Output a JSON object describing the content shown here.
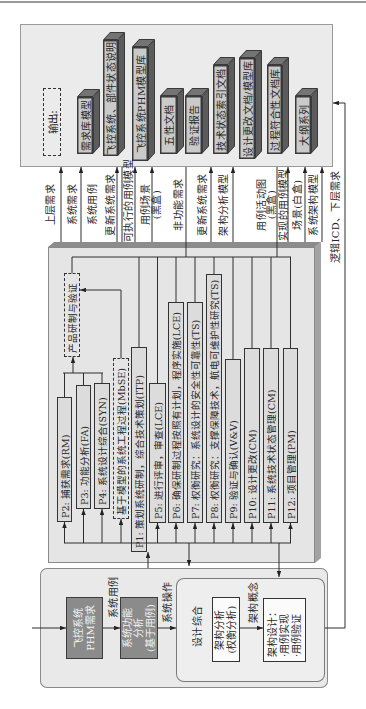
{
  "figure": {
    "output_panel": {
      "title": "输出:",
      "items": [
        {
          "label": "需求库模型"
        },
        {
          "label": "飞控系统、部件状态说明"
        },
        {
          "label": "飞控系统PHM模型库"
        },
        {
          "label": "五性文档"
        },
        {
          "label": "验证报告"
        },
        {
          "label": "技术状态索引文档"
        },
        {
          "label": "设计更改文档/模型库"
        },
        {
          "label": "过程符合性文档库"
        },
        {
          "label": "大纲系列"
        }
      ]
    },
    "flow_labels": [
      {
        "lines": [
          "上层需求"
        ]
      },
      {
        "lines": [
          "系统需求"
        ]
      },
      {
        "lines": [
          "系统用例"
        ]
      },
      {
        "lines": [
          "更新系统需求"
        ]
      },
      {
        "lines": [
          "可执行的用例模型"
        ]
      },
      {
        "lines": [
          "用例场景",
          "(黑盒)"
        ]
      },
      {
        "lines": [
          "非功能需求"
        ]
      },
      {
        "lines": [
          "更新系统需求"
        ]
      },
      {
        "lines": [
          "架构分析模型"
        ]
      },
      {
        "lines": [
          "用例活动图",
          "(黑盒)"
        ]
      },
      {
        "lines": [
          "实现的用例模型"
        ]
      },
      {
        "lines": [
          "场景(白盒)"
        ]
      },
      {
        "lines": [
          "系统架构模型"
        ]
      }
    ],
    "feedback_label": "逻辑ICD、下层需求",
    "process_panel": {
      "group_label": "产品研制与验证",
      "mbse_label": "基于模型的系统工程过程(MbSE)",
      "processes": [
        {
          "id": "P2",
          "label": "P2: 捕获需求(RM)"
        },
        {
          "id": "P3",
          "label": "P3: 功能分析(FA)"
        },
        {
          "id": "P4",
          "label": "P4: 系统设计综合(SYN)"
        },
        {
          "id": "P1",
          "label": "P1: 策划系统研制，综合技术策划(ITP)"
        },
        {
          "id": "P5",
          "label": "P5: 进行评审，审查(LCE)"
        },
        {
          "id": "P6",
          "label": "P6: 确保研制过程按照有计划，程序实施(LCE)"
        },
        {
          "id": "P7",
          "label": "P7: 权衡研究：系统设计的安全性可靠性(TS)"
        },
        {
          "id": "P8",
          "label": "P8: 权衡研究：支撑保障技术，航电可维护性研究(TS)"
        },
        {
          "id": "P9",
          "label": "P9: 验证与确认(V&V)"
        },
        {
          "id": "P10",
          "label": "P10: 设计更改(CM)"
        },
        {
          "id": "P11",
          "label": "P11: 系统技术状态管理(CM)"
        },
        {
          "id": "P12",
          "label": "P12: 项目管理(PM)"
        }
      ]
    },
    "design_panel": {
      "requirement_box": {
        "lines": [
          "飞控系统",
          "PHM需求"
        ]
      },
      "arrow_label_1": "系统用例",
      "function_box": {
        "lines": [
          "系统功能",
          "分析",
          "(基于用例)"
        ]
      },
      "arrow_label_2": "系统操作",
      "synthesis": {
        "title": "设计综合",
        "analysis_box": {
          "lines": [
            "架构分析",
            "(权衡分析)"
          ]
        },
        "arrow_label": "架构概念",
        "design_box": {
          "lines": [
            "架构设计：",
            "·用例实现",
            "·用例验证"
          ]
        }
      }
    }
  }
}
